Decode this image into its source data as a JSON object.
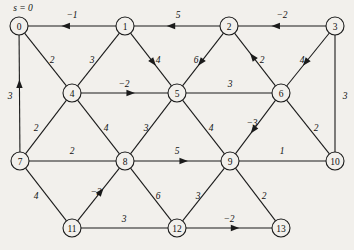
{
  "diagram": {
    "source_annotation": "s = 0",
    "source_node": "0",
    "background_color": "#f2f0ec",
    "ink_color": "#1b1b1b",
    "nodes": [
      {
        "id": "0",
        "label": "0",
        "x": 19,
        "y": 26
      },
      {
        "id": "1",
        "label": "1",
        "x": 125,
        "y": 26
      },
      {
        "id": "2",
        "label": "2",
        "x": 229,
        "y": 26
      },
      {
        "id": "3",
        "label": "3",
        "x": 335,
        "y": 26
      },
      {
        "id": "4",
        "label": "4",
        "x": 72,
        "y": 93
      },
      {
        "id": "5",
        "label": "5",
        "x": 177,
        "y": 93
      },
      {
        "id": "6",
        "label": "6",
        "x": 281,
        "y": 93
      },
      {
        "id": "7",
        "label": "7",
        "x": 20,
        "y": 161
      },
      {
        "id": "8",
        "label": "8",
        "x": 125,
        "y": 161
      },
      {
        "id": "9",
        "label": "9",
        "x": 230,
        "y": 161
      },
      {
        "id": "10",
        "label": "10",
        "x": 335,
        "y": 161
      },
      {
        "id": "11",
        "label": "11",
        "x": 72,
        "y": 228
      },
      {
        "id": "12",
        "label": "12",
        "x": 177,
        "y": 228
      },
      {
        "id": "13",
        "label": "13",
        "x": 281,
        "y": 228
      }
    ],
    "node_radius": 9,
    "edges": [
      {
        "from": "1",
        "to": "0",
        "weight": "−1",
        "directed": true,
        "label_x": 72,
        "label_y": 15
      },
      {
        "from": "2",
        "to": "1",
        "weight": "5",
        "directed": true,
        "label_x": 178,
        "label_y": 15
      },
      {
        "from": "3",
        "to": "2",
        "weight": "−2",
        "directed": true,
        "label_x": 282,
        "label_y": 15
      },
      {
        "from": "7",
        "to": "0",
        "weight": "3",
        "directed": true,
        "label_x": 10,
        "label_y": 96
      },
      {
        "from": "0",
        "to": "4",
        "weight": "2",
        "directed": false,
        "label_x": 52,
        "label_y": 60
      },
      {
        "from": "4",
        "to": "1",
        "weight": "3",
        "directed": false,
        "label_x": 92,
        "label_y": 60
      },
      {
        "from": "1",
        "to": "5",
        "weight": "4",
        "directed": true,
        "label_x": 158,
        "label_y": 60
      },
      {
        "from": "2",
        "to": "5",
        "weight": "6",
        "directed": true,
        "label_x": 196,
        "label_y": 60
      },
      {
        "from": "6",
        "to": "2",
        "weight": "2",
        "directed": true,
        "label_x": 262,
        "label_y": 60
      },
      {
        "from": "3",
        "to": "6",
        "weight": "4",
        "directed": true,
        "label_x": 302,
        "label_y": 60
      },
      {
        "from": "4",
        "to": "5",
        "weight": "−2",
        "directed": true,
        "label_x": 124,
        "label_y": 84
      },
      {
        "from": "5",
        "to": "6",
        "weight": "3",
        "directed": false,
        "label_x": 230,
        "label_y": 84
      },
      {
        "from": "3",
        "to": "10",
        "weight": "3",
        "directed": false,
        "label_x": 345,
        "label_y": 96
      },
      {
        "from": "7",
        "to": "4",
        "weight": "2",
        "directed": false,
        "label_x": 36,
        "label_y": 128
      },
      {
        "from": "4",
        "to": "8",
        "weight": "4",
        "directed": false,
        "label_x": 106,
        "label_y": 128
      },
      {
        "from": "8",
        "to": "5",
        "weight": "3",
        "directed": false,
        "label_x": 146,
        "label_y": 128
      },
      {
        "from": "5",
        "to": "9",
        "weight": "4",
        "directed": false,
        "label_x": 211,
        "label_y": 128
      },
      {
        "from": "6",
        "to": "9",
        "weight": "−3",
        "directed": true,
        "label_x": 252,
        "label_y": 123
      },
      {
        "from": "6",
        "to": "10",
        "weight": "2",
        "directed": false,
        "label_x": 316,
        "label_y": 128
      },
      {
        "from": "7",
        "to": "8",
        "weight": "2",
        "directed": false,
        "label_x": 72,
        "label_y": 151
      },
      {
        "from": "8",
        "to": "9",
        "weight": "5",
        "directed": true,
        "label_x": 177,
        "label_y": 151
      },
      {
        "from": "9",
        "to": "10",
        "weight": "1",
        "directed": false,
        "label_x": 282,
        "label_y": 151
      },
      {
        "from": "7",
        "to": "11",
        "weight": "4",
        "directed": false,
        "label_x": 36,
        "label_y": 196
      },
      {
        "from": "11",
        "to": "8",
        "weight": "−2",
        "directed": true,
        "label_x": 96,
        "label_y": 192
      },
      {
        "from": "8",
        "to": "12",
        "weight": "6",
        "directed": false,
        "label_x": 158,
        "label_y": 196
      },
      {
        "from": "9",
        "to": "12",
        "weight": "3",
        "directed": false,
        "label_x": 198,
        "label_y": 196
      },
      {
        "from": "9",
        "to": "13",
        "weight": "2",
        "directed": false,
        "label_x": 264,
        "label_y": 196
      },
      {
        "from": "11",
        "to": "12",
        "weight": "3",
        "directed": false,
        "label_x": 124,
        "label_y": 219
      },
      {
        "from": "12",
        "to": "13",
        "weight": "−2",
        "directed": true,
        "label_x": 229,
        "label_y": 219
      }
    ]
  }
}
